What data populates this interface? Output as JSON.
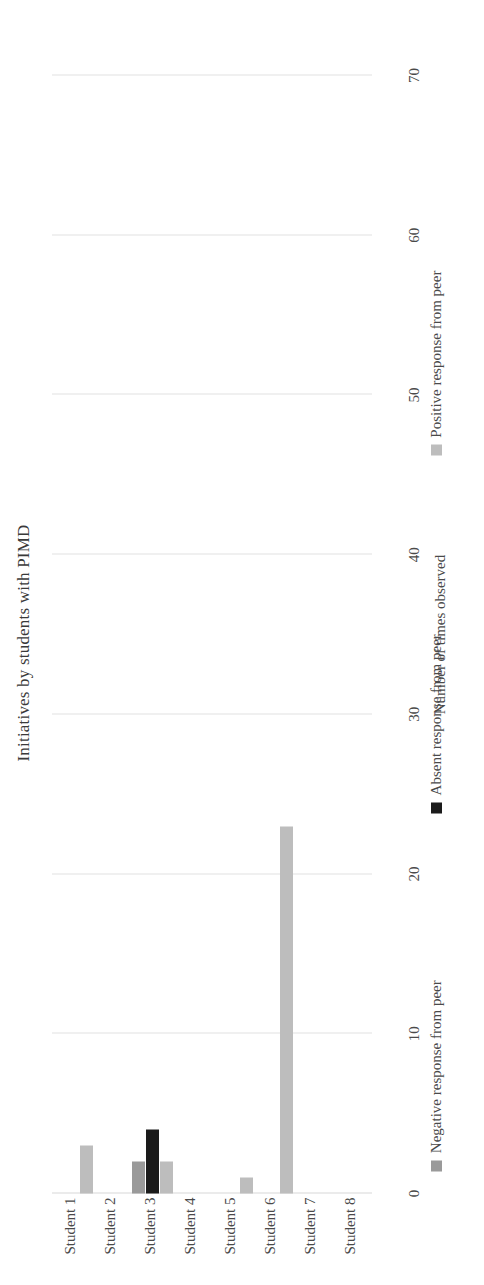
{
  "chart_data": {
    "type": "bar",
    "orientation": "horizontal",
    "title": "Initiatives by students with PIMD",
    "xlabel": "",
    "ylabel": "Number of times observed",
    "categories": [
      "Student 1",
      "Student 2",
      "Student 3",
      "Student 4",
      "Student 5",
      "Student 6",
      "Student 7",
      "Student 8"
    ],
    "ticks": [
      "0",
      "10",
      "20",
      "30",
      "40",
      "50",
      "60",
      "70"
    ],
    "ylim": [
      0,
      70
    ],
    "grid": true,
    "legend_position": "bottom",
    "series": [
      {
        "name": "Negative response from peer",
        "color": "#9a9a9a",
        "values": [
          0,
          0,
          2,
          0,
          0,
          0,
          0,
          0
        ]
      },
      {
        "name": "Absent response from peer",
        "color": "#1b1b1b",
        "values": [
          0,
          0,
          4,
          0,
          0,
          0,
          0,
          0
        ]
      },
      {
        "name": "Positive response from peer",
        "color": "#bdbdbd",
        "values": [
          3,
          0,
          2,
          0,
          1,
          23,
          0,
          0
        ]
      }
    ]
  }
}
